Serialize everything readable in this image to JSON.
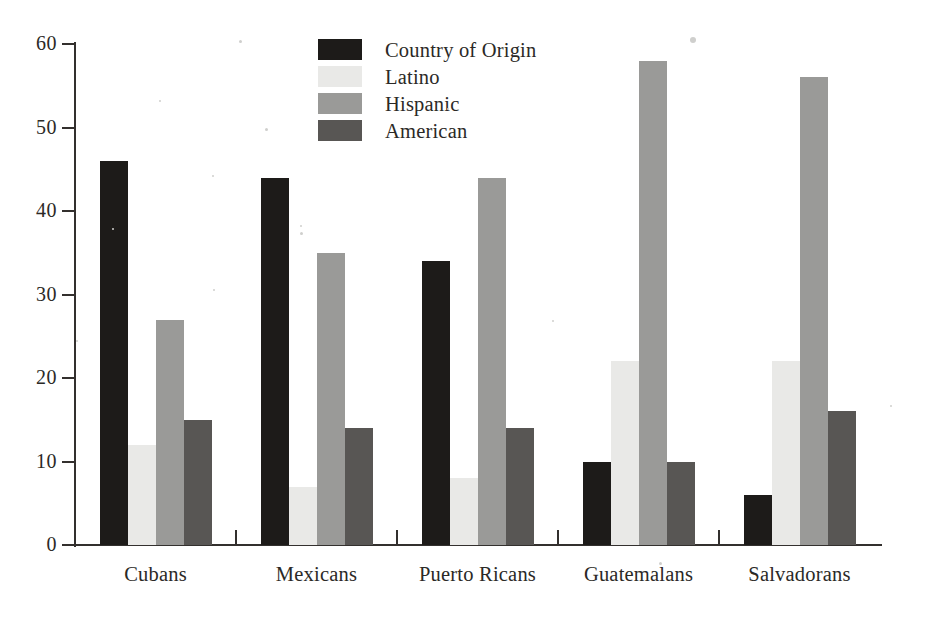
{
  "chart_data": {
    "type": "bar",
    "title": "",
    "subtitle": "",
    "xlabel": "",
    "ylabel": "",
    "grid": false,
    "legend_position": "top-center",
    "orientation": "vertical",
    "grouping": "grouped",
    "categories": [
      "Cubans",
      "Mexicans",
      "Puerto Ricans",
      "Guatemalans",
      "Salvadorans"
    ],
    "ylim": [
      0,
      60
    ],
    "yticks": [
      0,
      10,
      20,
      30,
      40,
      50,
      60
    ],
    "ytick_labels": [
      "0",
      "10",
      "20",
      "30",
      "40",
      "50",
      "60"
    ],
    "series": [
      {
        "name": "Country of Origin",
        "color": "#1d1b19",
        "values": [
          46,
          44,
          34,
          10,
          6
        ]
      },
      {
        "name": "Latino",
        "color": "#e9e9e7",
        "values": [
          12,
          7,
          8,
          22,
          22
        ]
      },
      {
        "name": "Hispanic",
        "color": "#9a9a98",
        "values": [
          27,
          35,
          44,
          58,
          56
        ]
      },
      {
        "name": "American",
        "color": "#585654",
        "values": [
          15,
          14,
          14,
          10,
          16
        ]
      }
    ]
  },
  "legend": {
    "items": [
      {
        "label": "Country of Origin",
        "color": "#1d1b19"
      },
      {
        "label": "Latino",
        "color": "#e9e9e7"
      },
      {
        "label": "Hispanic",
        "color": "#9a9a98"
      },
      {
        "label": "American",
        "color": "#585654"
      }
    ]
  },
  "axes": {
    "y_tick_labels": [
      "60",
      "50",
      "40",
      "30",
      "20",
      "10",
      "0"
    ],
    "x_category_labels": [
      "Cubans",
      "Mexicans",
      "Puerto Ricans",
      "Guatemalans",
      "Salvadorans"
    ]
  },
  "colors": {
    "axis": "#33302e",
    "text": "#2b2926",
    "background": "#ffffff",
    "series_0": "#1d1b19",
    "series_1": "#e9e9e7",
    "series_2": "#9a9a98",
    "series_3": "#585654"
  }
}
